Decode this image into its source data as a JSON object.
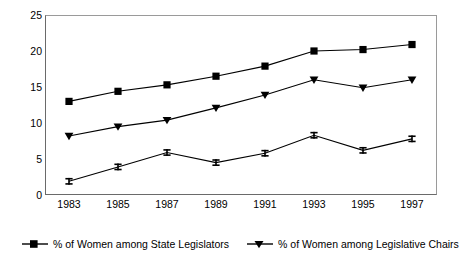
{
  "chart_data": {
    "type": "line",
    "title": "",
    "subtitle": "",
    "xlabel": "",
    "ylabel": "",
    "categories": [
      "1983",
      "1985",
      "1987",
      "1989",
      "1991",
      "1993",
      "1995",
      "1997"
    ],
    "x": [
      1983,
      1985,
      1987,
      1989,
      1991,
      1993,
      1995,
      1997
    ],
    "ylim": [
      0,
      25
    ],
    "yticks": [
      0,
      5,
      10,
      15,
      20,
      25
    ],
    "ytick_labels": [
      "0",
      "5",
      "10",
      "15",
      "20",
      "25"
    ],
    "grid": false,
    "legend_position": "bottom",
    "series": [
      {
        "name": "% of Women among State Legislators",
        "marker": "square",
        "color": "#000000",
        "values": [
          13.0,
          14.4,
          15.3,
          16.5,
          17.9,
          20.0,
          20.2,
          20.9
        ]
      },
      {
        "name": "% of Women among Legislative Chairs",
        "marker": "triangle-down",
        "color": "#000000",
        "values": [
          8.2,
          9.5,
          10.4,
          12.1,
          13.9,
          16.0,
          14.9,
          16.0
        ]
      },
      {
        "name": "",
        "marker": "i-beam",
        "color": "#000000",
        "values": [
          1.9,
          3.9,
          5.9,
          4.5,
          5.8,
          8.3,
          6.2,
          7.8
        ]
      }
    ]
  },
  "legend": {
    "entries": [
      {
        "label": "% of Women among State Legislators",
        "marker": "square"
      },
      {
        "label": "% of Women among Legislative Chairs",
        "marker": "triangle-down"
      }
    ]
  },
  "axes": {
    "y_labels": [
      "25",
      "20",
      "15",
      "10",
      "5",
      "0"
    ],
    "x_labels": [
      "1983",
      "1985",
      "1987",
      "1989",
      "1991",
      "1993",
      "1995",
      "1997"
    ]
  },
  "colors": {
    "line": "#000000",
    "frame": "#8f8f8f",
    "background": "#ffffff",
    "text": "#000000"
  }
}
